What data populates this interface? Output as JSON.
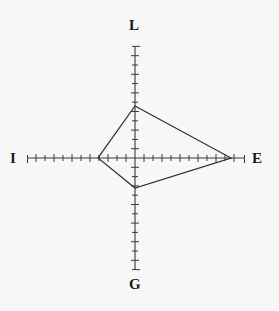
{
  "figure": {
    "name": "lego-radar-kite-diagram",
    "background_color": "#f7f7f7",
    "line_color": "#303030",
    "axis_color": "#3a3a3a",
    "center": {
      "x": 135,
      "y": 158
    },
    "axes": [
      {
        "id": "L",
        "label": "L",
        "direction": "up",
        "axis_length_px": 112,
        "tick_count": 12,
        "tick_spacing_px": 9.3
      },
      {
        "id": "E",
        "label": "E",
        "direction": "right",
        "axis_length_px": 110,
        "tick_count": 12,
        "tick_spacing_px": 9.2
      },
      {
        "id": "G",
        "label": "G",
        "direction": "down",
        "axis_length_px": 112,
        "tick_count": 12,
        "tick_spacing_px": 9.3
      },
      {
        "id": "I",
        "label": "I",
        "direction": "left",
        "axis_length_px": 108,
        "tick_count": 12,
        "tick_spacing_px": 9.0
      }
    ]
  },
  "chart_data": {
    "type": "radar",
    "title": "",
    "categories": [
      "L",
      "E",
      "G",
      "I"
    ],
    "axis_directions": [
      "up",
      "right",
      "down",
      "left"
    ],
    "values": [
      0.46,
      0.87,
      0.27,
      0.34
    ],
    "values_px_from_center": [
      52,
      96,
      30,
      37
    ],
    "axis_full_scale_px": [
      112,
      110,
      112,
      108
    ],
    "rlim": [
      0,
      1
    ],
    "grid": false,
    "ticks_per_axis": 12,
    "legend": "none",
    "vertices_px": [
      {
        "axis": "L",
        "x": 135,
        "y": 106
      },
      {
        "axis": "E",
        "x": 231,
        "y": 158
      },
      {
        "axis": "G",
        "x": 135,
        "y": 188
      },
      {
        "axis": "I",
        "x": 98,
        "y": 158
      }
    ],
    "series": [
      {
        "name": "profile",
        "values": [
          0.46,
          0.87,
          0.27,
          0.34
        ]
      }
    ]
  },
  "labels": {
    "top": "L",
    "right": "E",
    "bottom": "G",
    "left": "I"
  }
}
